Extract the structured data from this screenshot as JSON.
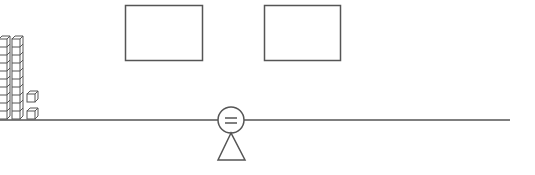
{
  "diagram": {
    "type": "balance-scale-equation",
    "left_side": {
      "tens_rods": 2,
      "unit_cubes": 2,
      "value": 22
    },
    "answer_boxes": [
      {
        "label": "",
        "value": ""
      },
      {
        "label": "",
        "value": ""
      }
    ],
    "fulcrum_symbol": "=",
    "colors": {
      "line": "#555555",
      "background": "#ffffff"
    }
  }
}
